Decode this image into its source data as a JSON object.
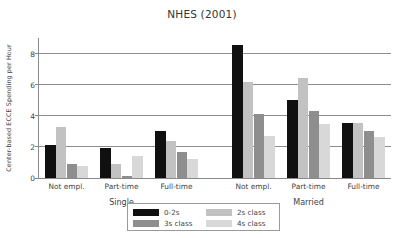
{
  "chart_data": {
    "type": "bar",
    "title": "NHES (2001)",
    "xlabel": "",
    "ylabel": "Center-based ECCE Spending per Hour",
    "ylim": [
      0,
      9
    ],
    "yticks": [
      0,
      2,
      4,
      6,
      8
    ],
    "ytick_labels": [
      "0",
      "2",
      "4",
      "6",
      "8"
    ],
    "grid": "horizontal",
    "legend_position": "below-center",
    "categories": [
      "Not empl.",
      "Part-time",
      "Full-time",
      "Not empl.",
      "Part-time",
      "Full-time"
    ],
    "group_labels": [
      "Single",
      "Married"
    ],
    "groups": [
      {
        "name": "Single",
        "categories": [
          "Not empl.",
          "Part-time",
          "Full-time"
        ]
      },
      {
        "name": "Married",
        "categories": [
          "Not empl.",
          "Part-time",
          "Full-time"
        ]
      }
    ],
    "series": [
      {
        "name": "0-2s",
        "color": "#101010",
        "values": [
          2.1,
          1.95,
          3.0,
          8.55,
          5.0,
          3.55
        ]
      },
      {
        "name": "2s class",
        "color": "#c2c2c2",
        "values": [
          3.25,
          0.9,
          2.35,
          6.2,
          6.4,
          3.55
        ]
      },
      {
        "name": "3s class",
        "color": "#8e8e8e",
        "values": [
          0.9,
          0.1,
          1.7,
          4.1,
          4.3,
          3.0
        ]
      },
      {
        "name": "4s class",
        "color": "#d8d8d8",
        "values": [
          0.8,
          1.4,
          1.25,
          2.7,
          3.5,
          2.65
        ]
      }
    ]
  },
  "legend": {
    "entries": [
      {
        "label": "0-2s",
        "color": "#101010"
      },
      {
        "label": "2s class",
        "color": "#c2c2c2"
      },
      {
        "label": "3s class",
        "color": "#8e8e8e"
      },
      {
        "label": "4s class",
        "color": "#d8d8d8"
      }
    ]
  },
  "colors": {
    "axis": "#8a8a8a",
    "grid": "#8d8d8d",
    "text": "#3f3f3f",
    "background": "#ffffff"
  }
}
